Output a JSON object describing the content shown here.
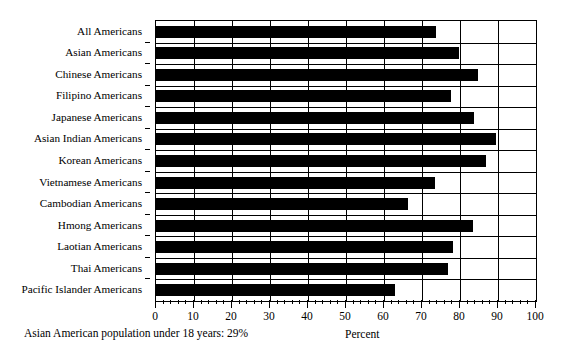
{
  "chart_data": {
    "type": "bar",
    "orientation": "horizontal",
    "title": "",
    "xlabel": "Percent",
    "ylabel": "",
    "xlim": [
      0,
      100
    ],
    "xticks": [
      0,
      10,
      20,
      30,
      40,
      50,
      60,
      70,
      80,
      90,
      100
    ],
    "xtick_labels": [
      "0",
      "10",
      "20",
      "30",
      "40",
      "50",
      "60",
      "70",
      "80",
      "90",
      "100"
    ],
    "minor_tick_interval": 2,
    "grid": "vertical-and-horizontal",
    "legend": "none",
    "bar_color": "#000000",
    "categories": [
      "All Americans",
      "Asian Americans",
      "Chinese Americans",
      "Filipino Americans",
      "Japanese Americans",
      "Asian Indian Americans",
      "Korean Americans",
      "Vietnamese Americans",
      "Cambodian Americans",
      "Hmong Americans",
      "Laotian Americans",
      "Thai Americans",
      "Pacific Islander Americans"
    ],
    "values": [
      73.7,
      79.7,
      84.7,
      77.6,
      83.7,
      89.5,
      86.8,
      73.4,
      66.3,
      83.4,
      78.2,
      76.8,
      62.9
    ],
    "annotations": [
      "Asian American population under 18 years: 29%"
    ]
  },
  "footnote": {
    "text": "Asian American population under 18 years: 29%"
  },
  "axis": {
    "x_title": "Percent"
  }
}
